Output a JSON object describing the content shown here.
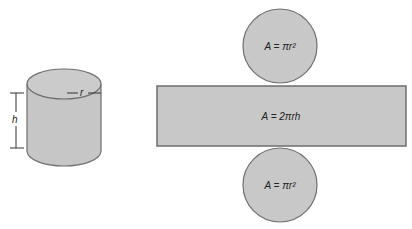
{
  "diagram": {
    "cylinder": {
      "radius_label": "r",
      "height_label": "h"
    },
    "net": {
      "top_circle_formula": "A = πr²",
      "rectangle_formula": "A = 2πrh",
      "bottom_circle_formula": "A = πr²"
    },
    "colors": {
      "fill": "#c8c8c8",
      "stroke": "#707070",
      "text": "#222222"
    }
  }
}
